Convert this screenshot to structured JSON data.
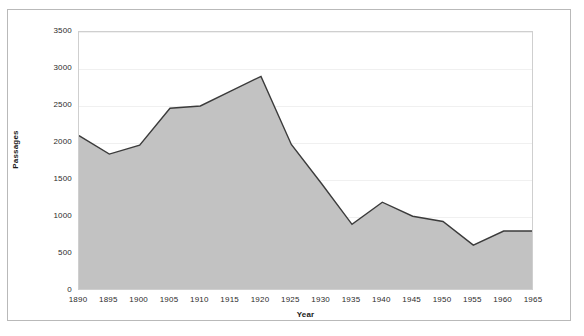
{
  "chart_data": {
    "type": "area",
    "title": "",
    "xlabel": "Year",
    "ylabel": "Passages",
    "x": [
      1890,
      1895,
      1900,
      1905,
      1910,
      1915,
      1920,
      1925,
      1930,
      1935,
      1940,
      1945,
      1950,
      1955,
      1960,
      1965
    ],
    "values": [
      2100,
      1850,
      1970,
      2470,
      2500,
      2700,
      2900,
      1980,
      1450,
      900,
      1200,
      1010,
      940,
      620,
      810,
      810
    ],
    "categories": [
      "1890",
      "1895",
      "1900",
      "1905",
      "1910",
      "1915",
      "1920",
      "1925",
      "1930",
      "1935",
      "1940",
      "1945",
      "1950",
      "1955",
      "1960",
      "1965"
    ],
    "xtick_labels": [
      "1890",
      "1895",
      "1900",
      "1905",
      "1910",
      "1915",
      "1920",
      "1925",
      "1930",
      "1935",
      "1940",
      "1945",
      "1950",
      "1955",
      "1960",
      "1965"
    ],
    "ytick_labels": [
      "0",
      "500",
      "1000",
      "1500",
      "2000",
      "2500",
      "3000",
      "3500"
    ],
    "ytick_values": [
      0,
      500,
      1000,
      1500,
      2000,
      2500,
      3000,
      3500
    ],
    "xlim": [
      1890,
      1965
    ],
    "ylim": [
      0,
      3500
    ],
    "grid": true,
    "legend": null,
    "series": [
      {
        "name": "Passages",
        "values": [
          2100,
          1850,
          1970,
          2470,
          2500,
          2700,
          2900,
          1980,
          1450,
          900,
          1200,
          1010,
          940,
          620,
          810,
          810
        ],
        "fill_color": "#c2c2c2",
        "line_color": "#3b3b3b"
      }
    ],
    "colors": {
      "area_fill": "#c2c2c2",
      "line": "#3b3b3b",
      "grid": "#f0f0f0",
      "plot_border": "#cfcfcf",
      "outer_frame": "#b9b9b9",
      "background": "#ffffff",
      "tick_text": "#2b2b2b",
      "axis_title_text": "#1a1a1a"
    }
  }
}
